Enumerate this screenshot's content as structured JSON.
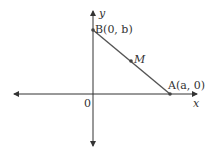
{
  "diagram": {
    "type": "coordinate-plane",
    "axes": {
      "x_label": "x",
      "y_label": "y",
      "origin_label": "0"
    },
    "points": [
      {
        "name": "B",
        "label": "B(0, b)",
        "coords": "(0, b)"
      },
      {
        "name": "M",
        "label": "M",
        "coords": "midpoint"
      },
      {
        "name": "A",
        "label": "A(a, 0)",
        "coords": "(a, 0)"
      }
    ],
    "segment": "AB",
    "colors": {
      "axis": "#333333",
      "segment": "#555555",
      "point": "#444444"
    }
  }
}
